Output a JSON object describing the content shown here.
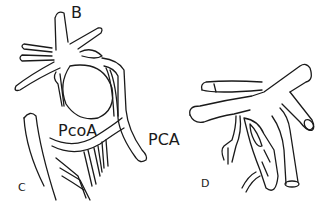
{
  "figure": {
    "panels": [
      {
        "id": "C",
        "panel_label": "C",
        "labels": {
          "top_vessel": "B",
          "communicating_artery": "PcoA",
          "posterior_cerebral_artery": "PCA"
        }
      },
      {
        "id": "D",
        "panel_label": "D"
      }
    ],
    "stray_label": "A",
    "colors": {
      "ink": "#1a1a1a",
      "background": "#ffffff"
    }
  }
}
